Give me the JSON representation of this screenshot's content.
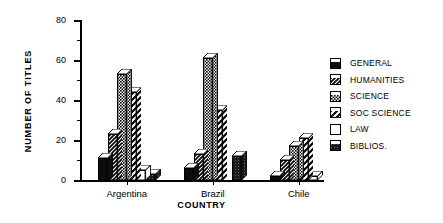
{
  "chart_data": {
    "type": "bar",
    "title": "",
    "xlabel": "COUNTRY",
    "ylabel": "NUMBER OF TITLES",
    "categories": [
      "Argentina",
      "Brazil",
      "Chile"
    ],
    "ylim": [
      0,
      80
    ],
    "yticks": [
      0,
      20,
      40,
      60,
      80
    ],
    "yticklabels": [
      "0",
      "20",
      "40",
      "60",
      "80"
    ],
    "yminorticks": [
      10,
      30,
      50,
      70
    ],
    "grid": false,
    "legend_position": "right",
    "series": [
      {
        "name": "GENERAL",
        "pattern": "solid-black",
        "color": "#111111",
        "values": [
          11,
          6,
          2
        ]
      },
      {
        "name": "HUMANITIES",
        "pattern": "diagonal-hatch",
        "color": "#333333",
        "values": [
          23,
          13,
          10
        ]
      },
      {
        "name": "SCIENCE",
        "pattern": "checker-gray",
        "color": "#808080",
        "values": [
          53,
          61,
          17
        ]
      },
      {
        "name": "SOC SCIENCE",
        "pattern": "wide-diagonal",
        "color": "#555555",
        "values": [
          44,
          35,
          21
        ]
      },
      {
        "name": "LAW",
        "pattern": "white",
        "color": "#ffffff",
        "values": [
          5,
          0,
          2
        ]
      },
      {
        "name": "BIBLIOS.",
        "pattern": "dark-stipple",
        "color": "#222222",
        "values": [
          3,
          12,
          0
        ]
      }
    ]
  },
  "legend": {
    "items": [
      {
        "label": "GENERAL"
      },
      {
        "label": "HUMANITIES"
      },
      {
        "label": "SCIENCE"
      },
      {
        "label": "SOC SCIENCE"
      },
      {
        "label": "LAW"
      },
      {
        "label": "BIBLIOS."
      }
    ]
  }
}
